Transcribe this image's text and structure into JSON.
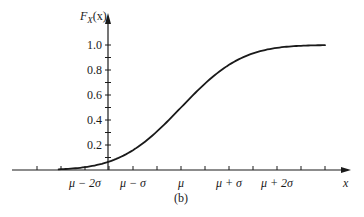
{
  "figure": {
    "caption": "(b)",
    "ylabel": "F",
    "ylabel_sub": "X",
    "ylabel_arg": "(x)",
    "xlabel": "x"
  },
  "colors": {
    "ink": "#1a1a1a",
    "background": "#ffffff"
  },
  "chart_data": {
    "type": "line",
    "title": "",
    "xlabel": "x",
    "ylabel": "F_X(x)",
    "x_tick_labels": [
      "μ − 2σ",
      "μ − σ",
      "μ",
      "μ + σ",
      "μ + 2σ"
    ],
    "x_tick_positions_sigma": [
      -2,
      -1,
      0,
      1,
      2
    ],
    "y_tick_labels": [
      "0.2",
      "0.4",
      "0.6",
      "0.8",
      "1.0"
    ],
    "y_ticks": [
      0.2,
      0.4,
      0.6,
      0.8,
      1.0
    ],
    "y_minor_ticks": [
      0.1,
      0.3,
      0.5,
      0.7,
      0.9
    ],
    "ylim": [
      0,
      1.05
    ],
    "xlim_sigma": [
      -3.0,
      3.0
    ],
    "grid": false,
    "legend": null,
    "series": [
      {
        "name": "F_X(x)",
        "x_sigma": [
          -2.5,
          -2.0,
          -1.5,
          -1.0,
          -0.5,
          0.0,
          0.5,
          1.0,
          1.5,
          2.0,
          2.5,
          3.0
        ],
        "values": [
          0.006,
          0.023,
          0.067,
          0.159,
          0.309,
          0.5,
          0.691,
          0.841,
          0.933,
          0.977,
          0.994,
          0.999
        ]
      }
    ]
  }
}
